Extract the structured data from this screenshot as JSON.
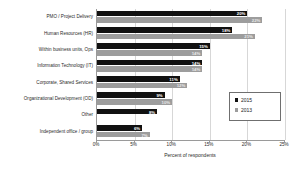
{
  "chart_data": {
    "type": "bar",
    "orientation": "horizontal",
    "title": "",
    "xlabel": "Percent of respondents",
    "ylabel": "",
    "xlim": [
      0,
      25
    ],
    "xticks": [
      "0%",
      "5%",
      "10%",
      "15%",
      "20%",
      "25%"
    ],
    "xtick_values": [
      0,
      5,
      10,
      15,
      20,
      25
    ],
    "grid": true,
    "legend_position": "middle-right",
    "categories": [
      "PMO / Project Delivery",
      "Human Resources (HR)",
      "Within business units, Ops",
      "Information Technology (IT)",
      "Corporate, Shared Services",
      "Organizational Development (OD)",
      "Other",
      "Independent office / group"
    ],
    "series": [
      {
        "name": "2015",
        "color": "#111111",
        "values": [
          20,
          18,
          15,
          14,
          11,
          9,
          8,
          6
        ],
        "labels": [
          "20%",
          "18%",
          "15%",
          "14%",
          "11%",
          "9%",
          "8%",
          "6%"
        ]
      },
      {
        "name": "2013",
        "color": "#9d9d9d",
        "values": [
          22,
          21,
          14,
          14,
          12,
          10,
          null,
          7
        ],
        "labels": [
          "22%",
          "21%",
          "14%",
          "14%",
          "12%",
          "10%",
          "",
          "7%"
        ]
      }
    ]
  },
  "legend": {
    "items": [
      {
        "label": "2015",
        "color": "#111111"
      },
      {
        "label": "2013",
        "color": "#9d9d9d"
      }
    ]
  },
  "ghost_top_text": ""
}
